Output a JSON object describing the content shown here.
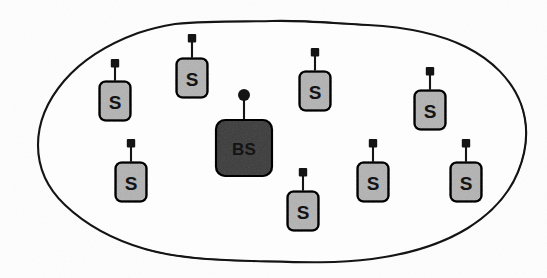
{
  "figure": {
    "background_color": "#fdfdfd",
    "stroke_color": "#141414",
    "width": 547,
    "height": 278
  },
  "region": {
    "name": "sensor-field-boundary",
    "shape": "hand-drawn-blob",
    "fill": "#fdfdfd",
    "stroke": "#141414",
    "stroke_width": 2.1,
    "bounds": {
      "x_min": 37,
      "y_min": 20,
      "x_max": 526,
      "y_max": 262
    }
  },
  "legend_colors": {
    "sensor_fill": "#d8d8d8",
    "base_station_fill": "#808080",
    "outline": "#141414",
    "antenna": "#141414"
  },
  "base_station": {
    "label": "BS",
    "role": "base-station",
    "x": 244,
    "y": 148,
    "width": 56,
    "height": 56,
    "corner_radius": 9,
    "fill": "#808080",
    "antenna_head": "round",
    "antenna_height": 26
  },
  "sensors": [
    {
      "id": 1,
      "label": "S",
      "x": 115,
      "y": 101,
      "width": 31,
      "height": 39,
      "fill": "#d8d8d8",
      "antenna_head": "square",
      "antenna_height": 20
    },
    {
      "id": 2,
      "label": "S",
      "x": 192,
      "y": 78,
      "width": 31,
      "height": 39,
      "fill": "#d8d8d8",
      "antenna_head": "square",
      "antenna_height": 22
    },
    {
      "id": 3,
      "label": "S",
      "x": 315,
      "y": 91,
      "width": 31,
      "height": 39,
      "fill": "#d8d8d8",
      "antenna_head": "square",
      "antenna_height": 21
    },
    {
      "id": 4,
      "label": "S",
      "x": 430,
      "y": 110,
      "width": 31,
      "height": 39,
      "fill": "#d8d8d8",
      "antenna_head": "square",
      "antenna_height": 21
    },
    {
      "id": 5,
      "label": "S",
      "x": 131,
      "y": 182,
      "width": 31,
      "height": 39,
      "fill": "#d8d8d8",
      "antenna_head": "square",
      "antenna_height": 21
    },
    {
      "id": 6,
      "label": "S",
      "x": 303,
      "y": 211,
      "width": 31,
      "height": 39,
      "fill": "#d8d8d8",
      "antenna_head": "square",
      "antenna_height": 21
    },
    {
      "id": 7,
      "label": "S",
      "x": 373,
      "y": 182,
      "width": 31,
      "height": 39,
      "fill": "#d8d8d8",
      "antenna_head": "square",
      "antenna_height": 21
    },
    {
      "id": 8,
      "label": "S",
      "x": 466,
      "y": 182,
      "width": 31,
      "height": 39,
      "fill": "#d8d8d8",
      "antenna_head": "square",
      "antenna_height": 21
    }
  ]
}
